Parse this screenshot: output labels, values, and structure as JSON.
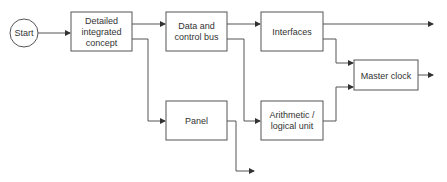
{
  "diagram": {
    "type": "flowchart",
    "stroke_color": "#555555",
    "text_color": "#333333",
    "nodes": [
      {
        "id": "start",
        "shape": "circle",
        "lines": [
          "Start"
        ]
      },
      {
        "id": "concept",
        "shape": "rect",
        "lines": [
          "Detailed",
          "integrated",
          "concept"
        ]
      },
      {
        "id": "bus",
        "shape": "rect",
        "lines": [
          "Data and",
          "control bus"
        ]
      },
      {
        "id": "interfaces",
        "shape": "rect",
        "lines": [
          "Interfaces"
        ]
      },
      {
        "id": "clock",
        "shape": "rect",
        "lines": [
          "Master clock"
        ]
      },
      {
        "id": "panel",
        "shape": "rect",
        "lines": [
          "Panel"
        ]
      },
      {
        "id": "alu",
        "shape": "rect",
        "lines": [
          "Arithmetic /",
          "logical unit"
        ]
      }
    ],
    "edges": [
      {
        "from": "start",
        "to": "concept"
      },
      {
        "from": "concept",
        "to": "bus"
      },
      {
        "from": "concept",
        "to": "panel"
      },
      {
        "from": "bus",
        "to": "interfaces"
      },
      {
        "from": "bus",
        "to": "alu"
      },
      {
        "from": "interfaces",
        "to": "output-top"
      },
      {
        "from": "interfaces",
        "to": "clock"
      },
      {
        "from": "alu",
        "to": "clock"
      },
      {
        "from": "clock",
        "to": "output-right"
      },
      {
        "from": "panel",
        "to": "output-bottom"
      }
    ]
  }
}
